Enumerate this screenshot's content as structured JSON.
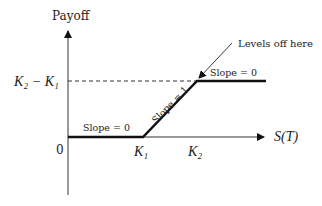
{
  "diagram": {
    "y_axis_label": "Payoff",
    "x_axis_label": "S(T)",
    "origin_label": "0",
    "y_tick_label": "K₂ − K₁",
    "x_ticks": [
      "K₁",
      "K₂"
    ],
    "segments": [
      {
        "label": "Slope = 0",
        "region": "S(T) < K₁"
      },
      {
        "label": "Slope = 1",
        "region": "K₁ < S(T) < K₂"
      },
      {
        "label": "Slope = 0",
        "region": "S(T) > K₂"
      }
    ],
    "annotation": "Levels off here",
    "colors": {
      "line": "#111111",
      "axis": "#333333",
      "text": "#222222"
    }
  }
}
